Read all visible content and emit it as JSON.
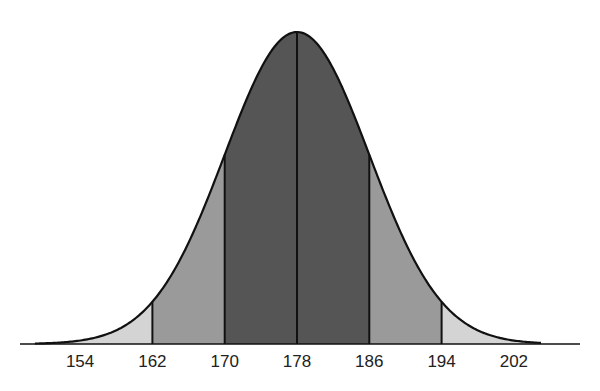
{
  "chart_data": {
    "type": "area",
    "title": "",
    "xlabel": "",
    "ylabel": "",
    "distribution": "normal",
    "mean": 178,
    "sd": 8,
    "tick_labels": [
      "154",
      "162",
      "170",
      "178",
      "186",
      "194",
      "202"
    ],
    "ticks": [
      154,
      162,
      170,
      178,
      186,
      194,
      202
    ],
    "xlim": [
      149,
      205
    ],
    "regions": [
      {
        "from": 149,
        "to": 162,
        "label": "beyond -2 SD",
        "color": "#d4d4d4"
      },
      {
        "from": 162,
        "to": 170,
        "label": "-2 to -1 SD",
        "color": "#9a9a9a"
      },
      {
        "from": 170,
        "to": 186,
        "label": "-1 to +1 SD",
        "color": "#555555"
      },
      {
        "from": 186,
        "to": 194,
        "label": "+1 to +2 SD",
        "color": "#9a9a9a"
      },
      {
        "from": 194,
        "to": 205,
        "label": "beyond +2 SD",
        "color": "#d4d4d4"
      }
    ],
    "vertical_lines": [
      162,
      170,
      178,
      186,
      194
    ],
    "grid": false,
    "legend": "none"
  },
  "colors": {
    "outer": "#d4d4d4",
    "middle": "#9a9a9a",
    "inner": "#555555",
    "line": "#111111"
  }
}
